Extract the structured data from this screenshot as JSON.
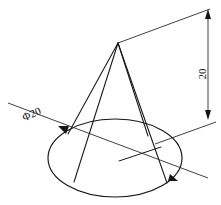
{
  "drawing": {
    "title": "Cone technical drawing with dimensions",
    "background_color": "#ffffff",
    "line_color": "#151515",
    "dimension_color": "#2a2a2a",
    "annotations": {
      "height": {
        "label": "20",
        "name": "height-dimension",
        "orientation": "vertical",
        "rotation_deg": -90,
        "position": {
          "x": 203,
          "y": 74
        }
      },
      "diameter": {
        "label": "Φ20",
        "name": "diameter-dimension",
        "orientation": "leader",
        "rotation_deg": -24,
        "position": {
          "x": 32,
          "y": 115
        }
      }
    },
    "geometry": {
      "apex": {
        "x": 118,
        "y": 43
      },
      "base_ellipse": {
        "cx": 115,
        "cy": 158,
        "rx": 67,
        "ry": 39
      },
      "cone_edges": [
        {
          "name": "left-outer-generatrix",
          "x1": 118,
          "y1": 43,
          "x2": 68,
          "y2": 134
        },
        {
          "name": "left-inner-generatrix",
          "x1": 118,
          "y1": 43,
          "x2": 74,
          "y2": 182
        },
        {
          "name": "right-inner-generatrix",
          "x1": 118,
          "y1": 43,
          "x2": 148,
          "y2": 136
        },
        {
          "name": "right-outer-generatrix",
          "x1": 118,
          "y1": 43,
          "x2": 167,
          "y2": 183
        }
      ],
      "diameter_leader": {
        "x1": 8,
        "y1": 103,
        "x2": 208,
        "y2": 178
      },
      "center_line": {
        "x1": 119,
        "y1": 161,
        "x2": 161,
        "y2": 147
      },
      "height_extension_top": {
        "x1": 118,
        "y1": 43,
        "x2": 210,
        "y2": 9
      },
      "height_dim_line": {
        "x1": 208,
        "y1": 10,
        "x2": 208,
        "y2": 119
      }
    }
  }
}
